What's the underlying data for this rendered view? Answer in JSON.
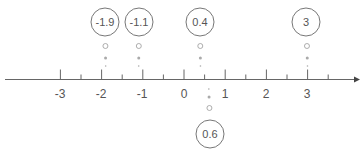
{
  "diagram": {
    "type": "number-line",
    "axis": {
      "min": -3,
      "max": 3,
      "tick_labels": [
        "-3",
        "-2",
        "-1",
        "0",
        "1",
        "2",
        "3"
      ],
      "minor_ticks": "half-units",
      "arrow": "right"
    },
    "points": [
      {
        "label": "-1.9",
        "value": -1.9,
        "position": "above"
      },
      {
        "label": "-1.1",
        "value": -1.1,
        "position": "above"
      },
      {
        "label": "0.4",
        "value": 0.4,
        "position": "above"
      },
      {
        "label": "3",
        "value": 3,
        "position": "above"
      },
      {
        "label": "0.6",
        "value": 0.6,
        "position": "below"
      }
    ]
  }
}
